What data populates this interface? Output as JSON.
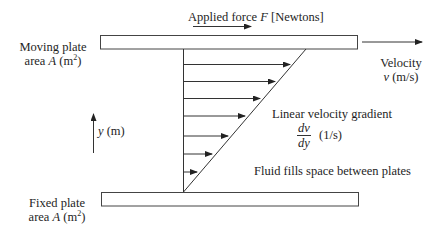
{
  "diagram": {
    "applied_force": {
      "prefix": "Applied force ",
      "symbol": "F",
      "unit": " [Newtons]"
    },
    "moving_plate": {
      "line1": "Moving plate",
      "line2_prefix": "area ",
      "symbol": "A",
      "unit_open": " (m",
      "unit_sup": "2",
      "unit_close": ")"
    },
    "fixed_plate": {
      "line1": "Fixed plate",
      "line2_prefix": "area ",
      "symbol": "A",
      "unit_open": " (m",
      "unit_sup": "2",
      "unit_close": ")"
    },
    "velocity": {
      "line1": "Velocity",
      "symbol": "v",
      "unit": " (m/s)"
    },
    "y_axis": {
      "symbol": "y",
      "unit": " (m)"
    },
    "gradient": {
      "label": "Linear velocity gradient",
      "numerator": "dv",
      "denominator": "dy",
      "unit": "(1/s)"
    },
    "fluid_note": "Fluid fills space between plates",
    "velocity_profile_arrows": 7,
    "colors": {
      "line": "#333333",
      "text": "#1e1e1e",
      "background": "#ffffff"
    }
  }
}
